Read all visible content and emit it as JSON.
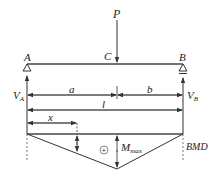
{
  "diagram": {
    "load": {
      "label": "P"
    },
    "points": {
      "left_support": "A",
      "load_point": "C",
      "right_support": "B"
    },
    "reactions": {
      "left": "V",
      "left_sub": "A",
      "right": "V",
      "right_sub": "B"
    },
    "dimensions": {
      "a": "a",
      "b": "b",
      "span": "l",
      "x": "x"
    },
    "bmd": {
      "sign": "+",
      "max_label": "M",
      "max_sub": "max",
      "tag": "BMD"
    }
  }
}
